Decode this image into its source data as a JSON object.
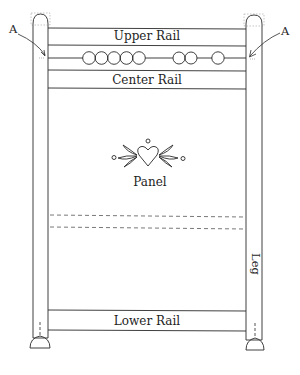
{
  "diagram": {
    "type": "furniture-construction",
    "labels": {
      "upper_rail": "Upper Rail",
      "center_rail": "Center Rail",
      "panel": "Panel",
      "lower_rail": "Lower Rail",
      "leg": "Leg",
      "callout_left": "A",
      "callout_right": "A"
    },
    "bead_strip": {
      "groups": [
        5,
        3
      ],
      "description": "spindle of turned beads between upper and center rails"
    },
    "panel_ornament": "heart with leaves and dots",
    "dashed_lines": 2,
    "colors": {
      "line": "#2a2a2a",
      "dashed": "#555555",
      "background": "#ffffff"
    }
  }
}
